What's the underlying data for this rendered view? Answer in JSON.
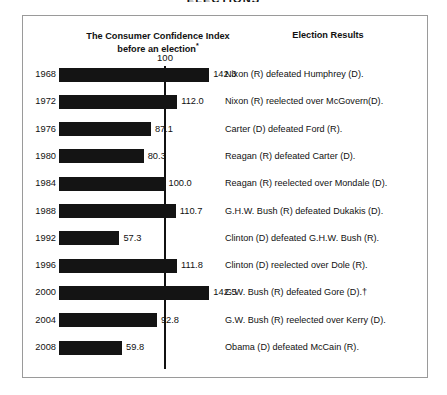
{
  "super_title": "ELECTIONS",
  "headers": {
    "chart_column_line1": "The Consumer Confidence Index",
    "chart_column_line2": "before an election",
    "chart_column_footnote_marker": "*",
    "results_column": "Election Results"
  },
  "axis": {
    "reference_label": "100"
  },
  "chart_data": {
    "type": "bar",
    "orientation": "horizontal",
    "title": "The Consumer Confidence Index before an election*",
    "xlabel": "",
    "ylabel": "",
    "reference_line": 100,
    "xlim": [
      0,
      150
    ],
    "grid": false,
    "legend": null,
    "categories": [
      "1968",
      "1972",
      "1976",
      "1980",
      "1984",
      "1988",
      "1992",
      "1996",
      "2000",
      "2004",
      "2008"
    ],
    "values": [
      142.3,
      112.0,
      87.1,
      80.3,
      100.0,
      110.7,
      57.3,
      111.8,
      142.5,
      92.8,
      59.8
    ],
    "value_labels": [
      "142.3",
      "112.0",
      "87.1",
      "80.3",
      "100.0",
      "110.7",
      "57.3",
      "111.8",
      "142.5",
      "92.8",
      "59.8"
    ],
    "annotations": [
      "1968: Nixon (R) defeated Humphrey (D).",
      "1972: Nixon (R) reelected over McGovern(D).",
      "1976: Carter (D) defeated Ford (R).",
      "1980: Reagan (R) defeated Carter (D).",
      "1984: Reagan (R) reelected over Mondale (D).",
      "1988: G.H.W. Bush (R) defeated Dukakis (D).",
      "1992: Clinton (D) defeated G.H.W. Bush (R).",
      "1996: Clinton (D) reelected over Dole (R).",
      "2000: G.W. Bush (R) defeated Gore (D).†",
      "2004: G.W. Bush (R) reelected over Kerry (D).",
      "2008: Obama (D) defeated McCain (R)."
    ],
    "bar_color": "#141414"
  },
  "rows": [
    {
      "year": "1968",
      "value": 142.3,
      "value_label": "142.3",
      "result": "Nixon (R) defeated Humphrey (D)."
    },
    {
      "year": "1972",
      "value": 112.0,
      "value_label": "112.0",
      "result": "Nixon (R) reelected over McGovern(D)."
    },
    {
      "year": "1976",
      "value": 87.1,
      "value_label": "87.1",
      "result": "Carter (D) defeated Ford (R)."
    },
    {
      "year": "1980",
      "value": 80.3,
      "value_label": "80.3",
      "result": "Reagan (R) defeated Carter (D)."
    },
    {
      "year": "1984",
      "value": 100.0,
      "value_label": "100.0",
      "result": "Reagan (R) reelected over Mondale (D)."
    },
    {
      "year": "1988",
      "value": 110.7,
      "value_label": "110.7",
      "result": "G.H.W. Bush (R) defeated Dukakis (D)."
    },
    {
      "year": "1992",
      "value": 57.3,
      "value_label": "57.3",
      "result": "Clinton (D) defeated G.H.W. Bush (R)."
    },
    {
      "year": "1996",
      "value": 111.8,
      "value_label": "111.8",
      "result": "Clinton (D) reelected over Dole (R)."
    },
    {
      "year": "2000",
      "value": 142.5,
      "value_label": "142.5",
      "result": "G.W. Bush (R) defeated Gore (D).†"
    },
    {
      "year": "2004",
      "value": 92.8,
      "value_label": "92.8",
      "result": "G.W. Bush (R) reelected over Kerry (D)."
    },
    {
      "year": "2008",
      "value": 59.8,
      "value_label": "59.8",
      "result": "Obama (D) defeated McCain (R)."
    }
  ],
  "colors": {
    "bar": "#141414",
    "axis_line": "#111111",
    "frame_border": "#9a9a9a",
    "text": "#1a1a1a",
    "background": "#ffffff"
  },
  "scale": {
    "px_per_unit": 1.055,
    "bar_origin_x": 36,
    "row_height": 27.3,
    "first_row_top": 50
  }
}
